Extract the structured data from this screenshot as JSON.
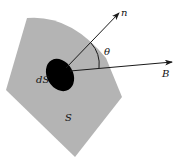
{
  "diagram": {
    "labels": {
      "normal": "n",
      "field": "B",
      "angle": "θ",
      "element": "dS",
      "surface": "S"
    },
    "colors": {
      "surface_fill": "#b4b4b4",
      "element_fill": "#000000",
      "line": "#1a1a1a",
      "background": "#ffffff"
    }
  }
}
